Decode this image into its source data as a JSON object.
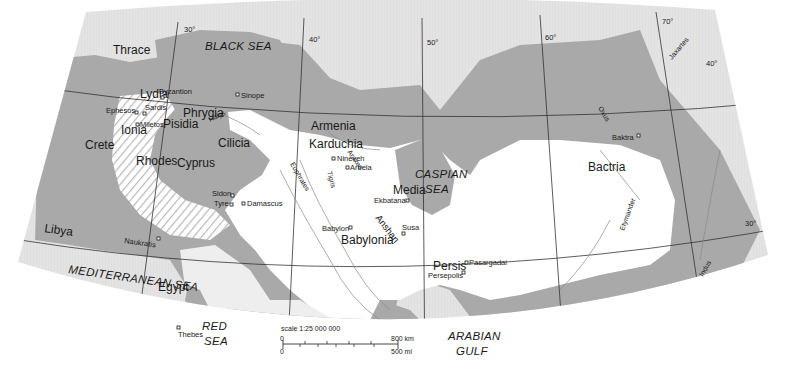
{
  "map": {
    "title": "",
    "colors": {
      "background": "#ffffff",
      "outside_land": "#e2e2e2",
      "water": "#a9a9a9",
      "empire_inner": "#ffffff",
      "empire_fringe": "#eeeeee",
      "grid": "#333333",
      "river": "#8a8a8a",
      "text": "#1a1a1a"
    },
    "longitudes": [
      "30°",
      "40°",
      "50°",
      "60°",
      "70°"
    ],
    "latitudes": [
      "40°",
      "30°"
    ],
    "seas": [
      {
        "name": "BLACK SEA",
        "x": 217,
        "y": 74
      },
      {
        "name": "CASPIAN SEA_1",
        "label": "CASPIAN",
        "x": 416,
        "y": 178
      },
      {
        "name": "CASPIAN SEA_2",
        "label": "SEA",
        "x": 428,
        "y": 193
      },
      {
        "name": "MEDITERRANEAN SEA",
        "x": 68,
        "y": 277
      },
      {
        "name": "RED SEA_1",
        "label": "RED",
        "x": 203,
        "y": 324
      },
      {
        "name": "RED SEA_2",
        "label": "SEA",
        "x": 205,
        "y": 339
      },
      {
        "name": "ARABIAN GULF_1",
        "label": "ARABIAN",
        "x": 446,
        "y": 339
      },
      {
        "name": "ARABIAN GULF_2",
        "label": "GULF",
        "x": 454,
        "y": 354
      }
    ],
    "regions": [
      {
        "name": "Thrace",
        "x": 113,
        "y": 77
      },
      {
        "name": "Lydia",
        "x": 138,
        "y": 130
      },
      {
        "name": "Phrygia",
        "x": 182,
        "y": 150
      },
      {
        "name": "Pisidia",
        "x": 157,
        "y": 167
      },
      {
        "name": "Ionia",
        "x": 121,
        "y": 175
      },
      {
        "name": "Cilicia",
        "x": 217,
        "y": 183
      },
      {
        "name": "Crete",
        "x": 84,
        "y": 193
      },
      {
        "name": "Rhodes",
        "x": 134,
        "y": 214
      },
      {
        "name": "Cyprus",
        "x": 175,
        "y": 217
      },
      {
        "name": "Armenia",
        "x": 310,
        "y": 156
      },
      {
        "name": "Karduchia",
        "x": 307,
        "y": 181
      },
      {
        "name": "Media",
        "x": 393,
        "y": 271
      },
      {
        "name": "Babylonia",
        "x": 340,
        "y": 270
      },
      {
        "name": "Persis",
        "x": 432,
        "y": 268
      },
      {
        "name": "Bactria",
        "x": 588,
        "y": 180
      },
      {
        "name": "Libya",
        "x": 42,
        "y": 262
      },
      {
        "name": "Egypt",
        "x": 157,
        "y": 310
      }
    ],
    "cities": [
      {
        "name": "Byzantion",
        "x": 164,
        "y": 98
      },
      {
        "name": "Sinope",
        "x": 236,
        "y": 95
      },
      {
        "name": "Sardis",
        "x": 144,
        "y": 148
      },
      {
        "name": "Ephesos",
        "x": 104,
        "y": 157
      },
      {
        "name": "Miletos",
        "x": 136,
        "y": 170
      },
      {
        "name": "Sidon",
        "x": 210,
        "y": 267
      },
      {
        "name": "Tyre",
        "x": 214,
        "y": 280
      },
      {
        "name": "Damascus",
        "x": 242,
        "y": 286
      },
      {
        "name": "Naukratis",
        "x": 124,
        "y": 341
      },
      {
        "name": "Thebes",
        "x": 177,
        "y": 378
      },
      {
        "name": "Nineveh",
        "x": 330,
        "y": 216
      },
      {
        "name": "Arbela",
        "x": 346,
        "y": 231
      },
      {
        "name": "Ekbatana",
        "x": 381,
        "y": 286
      },
      {
        "name": "Babylon",
        "x": 318,
        "y": 318
      },
      {
        "name": "Susa",
        "x": 397,
        "y": 318
      },
      {
        "name": "Pasargadai",
        "x": 460,
        "y": 369
      },
      {
        "name": "Persepolis",
        "x": 421,
        "y": 381
      },
      {
        "name": "Baktra",
        "x": 605,
        "y": 195
      }
    ],
    "rivers": [
      {
        "name": "Halys"
      },
      {
        "name": "Araxes"
      },
      {
        "name": "Euphrates"
      },
      {
        "name": "Tigris"
      },
      {
        "name": "Anshan"
      },
      {
        "name": "Oxus"
      },
      {
        "name": "Jaxartes"
      },
      {
        "name": "Etymander"
      },
      {
        "name": "Indus"
      }
    ],
    "scale": {
      "label": "scale 1:25 000 000",
      "zero_top": "0",
      "zero_bottom": "0",
      "km": "800 km",
      "mi": "500 mi"
    }
  }
}
